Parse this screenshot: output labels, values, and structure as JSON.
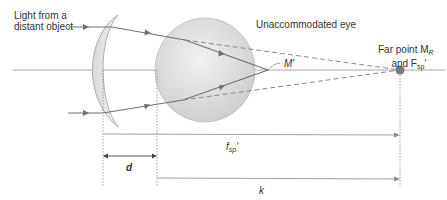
{
  "labels": {
    "light_source": [
      "Light from a",
      "distant object"
    ],
    "eye": "Unaccommodated eye",
    "m_prime": "M′",
    "far_point_line1": "Far point M",
    "far_point_line1_sub": "R",
    "far_point_line2_pre": "and F",
    "far_point_line2_sub": "sp",
    "far_point_line2_post": "′",
    "fsp": "f",
    "fsp_sub": "sp",
    "fsp_prime": "′",
    "d": "d",
    "k": "k"
  },
  "colors": {
    "ray": "#6b6b6b",
    "axis": "#9a9a9a",
    "lens_fill": "#e6e6e6",
    "eye_fill": "#dcdcdc",
    "far_point": "#7a7a7a"
  }
}
